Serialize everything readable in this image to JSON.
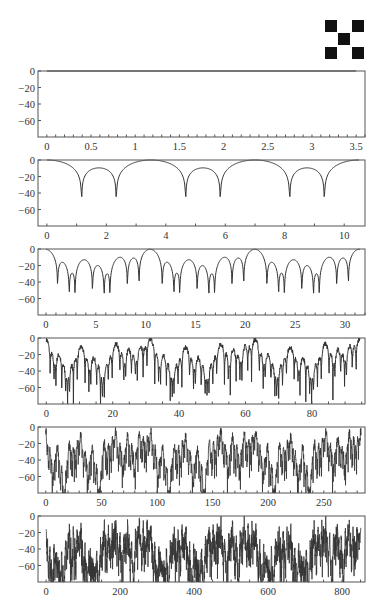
{
  "logo": {
    "icon": "checker-x-icon",
    "color": "#111111"
  },
  "layout": {
    "plot_left": 38,
    "plot_right": 365,
    "plot_height": 66,
    "panel_tops": [
      71,
      160,
      249,
      338,
      427,
      516
    ],
    "line_color": "#333333",
    "frame_color": "#555555"
  },
  "chart_data": [
    {
      "type": "line",
      "title": "",
      "xlabel": "",
      "ylabel": "",
      "xlim": [
        -0.1,
        3.6
      ],
      "ylim": [
        -80,
        0
      ],
      "xticks": [
        0,
        0.5,
        1,
        1.5,
        2,
        2.5,
        3,
        3.5
      ],
      "xtick_labels": [
        "0",
        "0.5",
        "1",
        "1.5",
        "2",
        "2.5",
        "3",
        "3.5"
      ],
      "yticks": [
        0,
        -20,
        -40,
        -60
      ],
      "ytick_labels": [
        "0",
        "−20",
        "−40",
        "−60"
      ],
      "minor_xticks_per_major": 5,
      "series": [
        {
          "name": "level 0",
          "x": [
            0,
            3.5
          ],
          "y": [
            0,
            0
          ],
          "note": "flat at 0 dB (coincides with top frame)"
        }
      ]
    },
    {
      "type": "line",
      "xlim": [
        -0.3,
        10.7
      ],
      "ylim": [
        -80,
        0
      ],
      "xticks": [
        0,
        2,
        4,
        6,
        8,
        10
      ],
      "xtick_labels": [
        "0",
        "2",
        "4",
        "6",
        "8",
        "10"
      ],
      "yticks": [
        0,
        -20,
        -40,
        -60
      ],
      "ytick_labels": [
        "0",
        "−20",
        "−40",
        "−60"
      ],
      "minor_xticks_per_major": 2,
      "series": [
        {
          "name": "level 1",
          "x_max": 10.5,
          "period": 3.5,
          "nulls": [
            0.85,
            2.1,
            3.85,
            5.1,
            6.85,
            8.1,
            9.85
          ],
          "null_depths": [
            -44,
            -46,
            -52,
            -48,
            -52,
            -50,
            -44
          ],
          "peaks": [
            0,
            3.0,
            6.0,
            9.0
          ],
          "sidelobe_level": -4
        }
      ]
    },
    {
      "type": "line",
      "xlim": [
        -0.8,
        32
      ],
      "ylim": [
        -80,
        0
      ],
      "xticks": [
        0,
        5,
        10,
        15,
        20,
        25,
        30
      ],
      "xtick_labels": [
        "0",
        "5",
        "10",
        "15",
        "20",
        "25",
        "30"
      ],
      "yticks": [
        0,
        -20,
        -40,
        -60
      ],
      "ytick_labels": [
        "0",
        "−20",
        "−40",
        "−60"
      ],
      "minor_xticks_per_major": 5,
      "series": [
        {
          "name": "level 2",
          "x_max": 31.5,
          "main_peaks": [
            0,
            9,
            18,
            27
          ],
          "sidelobe_level": -10,
          "deep_nulls": [
            [
              3.8,
              -80
            ],
            [
              6.3,
              -68
            ],
            [
              6.8,
              -80
            ],
            [
              18.8,
              -70
            ],
            [
              20.1,
              -74
            ]
          ],
          "typical_null_depth": -40
        }
      ]
    },
    {
      "type": "line",
      "xlim": [
        -2.5,
        96
      ],
      "ylim": [
        -80,
        0
      ],
      "xticks": [
        0,
        20,
        40,
        60,
        80
      ],
      "xtick_labels": [
        "0",
        "20",
        "40",
        "60",
        "80"
      ],
      "yticks": [
        0,
        -20,
        -40,
        -60
      ],
      "ytick_labels": [
        "0",
        "−20",
        "−40",
        "−60"
      ],
      "minor_xticks_per_major": 4,
      "series": [
        {
          "name": "level 3",
          "x_max": 94.5,
          "main_peaks": [
            0,
            27,
            54,
            81
          ],
          "sidelobe_level": -14,
          "null_depth_range": [
            -30,
            -80
          ]
        }
      ]
    },
    {
      "type": "line",
      "xlim": [
        -7,
        287
      ],
      "ylim": [
        -80,
        0
      ],
      "xticks": [
        0,
        50,
        100,
        150,
        200,
        250
      ],
      "xtick_labels": [
        "0",
        "50",
        "100",
        "150",
        "200",
        "250"
      ],
      "yticks": [
        0,
        -20,
        -40,
        -60
      ],
      "ytick_labels": [
        "0",
        "−20",
        "−40",
        "−60"
      ],
      "minor_xticks_per_major": 5,
      "series": [
        {
          "name": "level 4",
          "x_max": 283.5,
          "main_peaks": [
            0,
            81,
            162,
            243
          ],
          "sidelobe_level": -18,
          "null_depth_range": [
            -40,
            -80
          ]
        }
      ]
    },
    {
      "type": "line",
      "xlim": [
        -22,
        862
      ],
      "ylim": [
        -80,
        0
      ],
      "xticks": [
        0,
        200,
        400,
        600,
        800
      ],
      "xtick_labels": [
        "0",
        "200",
        "400",
        "600",
        "800"
      ],
      "yticks": [
        0,
        -20,
        -40,
        -60
      ],
      "ytick_labels": [
        "0",
        "−20",
        "−40",
        "−60"
      ],
      "minor_xticks_per_major": 4,
      "series": [
        {
          "name": "level 5",
          "x_max": 850.5,
          "main_peaks": [
            0,
            243,
            486,
            729
          ],
          "sidelobe_level": -22,
          "null_depth_range": [
            -50,
            -80
          ]
        }
      ]
    }
  ]
}
